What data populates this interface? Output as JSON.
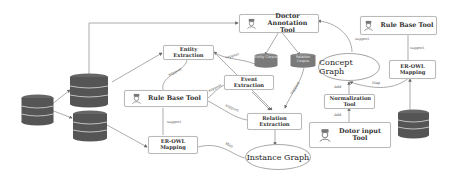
{
  "diagram": {
    "type": "system-architecture-flow",
    "nodes": {
      "doctor_annotation_tool": "Doctor Annotation Tool",
      "entity_corpus": "Entity Corpus",
      "relation_corpus": "Relation Corpus",
      "entity_extraction": "Entity Extraction",
      "event_extraction": "Event Extraction",
      "relation_extraction": "Relation Extraction",
      "rule_base_tool_left": "Rule Base Tool",
      "er_owl_mapping_left": "ER-OWL Mapping",
      "instance_graph": "Instance Graph",
      "concept_graph": "Concept Graph",
      "rule_base_tool_right": "Rule Base Tool",
      "er_owl_mapping_right": "ER-OWL Mapping",
      "normalization_tool": "Normalization Tool",
      "doctor_input_tool": "Dotor input Tool"
    },
    "edge_labels": {
      "support": "support",
      "map": "Map",
      "add": "Add"
    },
    "colors": {
      "database": "#555555",
      "border": "#b9b9b9",
      "edge": "#777777"
    }
  }
}
